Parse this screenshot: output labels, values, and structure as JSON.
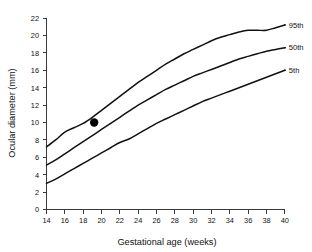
{
  "chart_data": {
    "type": "line",
    "title": "",
    "xlabel": "Gestational age (weeks)",
    "ylabel": "Ocular diameter (mm)",
    "xlim": [
      14,
      40
    ],
    "ylim": [
      0,
      22
    ],
    "xticks": [
      14,
      16,
      18,
      20,
      22,
      24,
      26,
      28,
      30,
      32,
      34,
      36,
      38,
      40
    ],
    "yticks": [
      0,
      2,
      4,
      6,
      8,
      10,
      12,
      14,
      16,
      18,
      20,
      22
    ],
    "grid": false,
    "legend_position": "right-of-curve-ends",
    "x": [
      14,
      15,
      16,
      17,
      18,
      19,
      20,
      21,
      22,
      23,
      24,
      25,
      26,
      27,
      28,
      29,
      30,
      31,
      32,
      33,
      34,
      35,
      36,
      37,
      38,
      39,
      40
    ],
    "series": [
      {
        "name": "95th",
        "label": "95th",
        "color": "#111111",
        "values": [
          7.2,
          8.0,
          8.9,
          9.4,
          9.9,
          10.6,
          11.4,
          12.2,
          13.0,
          13.8,
          14.6,
          15.3,
          16.0,
          16.7,
          17.3,
          17.9,
          18.4,
          18.9,
          19.4,
          19.8,
          20.1,
          20.4,
          20.6,
          20.6,
          20.6,
          20.9,
          21.2
        ]
      },
      {
        "name": "50th",
        "label": "50th",
        "color": "#111111",
        "values": [
          5.1,
          5.7,
          6.4,
          7.1,
          7.8,
          8.5,
          9.2,
          9.9,
          10.6,
          11.3,
          12.0,
          12.6,
          13.2,
          13.8,
          14.3,
          14.8,
          15.3,
          15.7,
          16.1,
          16.5,
          16.9,
          17.3,
          17.6,
          17.9,
          18.2,
          18.4,
          18.6
        ]
      },
      {
        "name": "5th",
        "label": "5th",
        "color": "#111111",
        "values": [
          3.0,
          3.5,
          4.1,
          4.7,
          5.3,
          5.9,
          6.5,
          7.1,
          7.7,
          8.1,
          8.7,
          9.3,
          9.9,
          10.4,
          10.9,
          11.4,
          11.9,
          12.4,
          12.8,
          13.2,
          13.6,
          14.0,
          14.4,
          14.8,
          15.2,
          15.6,
          16.0
        ]
      }
    ],
    "annotations": [
      {
        "name": "measurement-point",
        "marker": "filled-circle",
        "x": 19.2,
        "y": 10.0,
        "color": "#000000"
      }
    ]
  }
}
